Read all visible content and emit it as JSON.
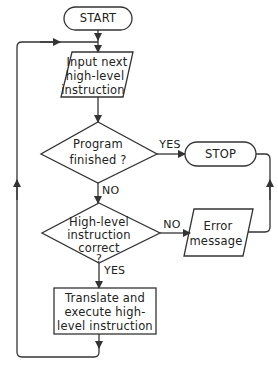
{
  "diagram": {
    "type": "flowchart",
    "colors": {
      "stroke": "#333333",
      "text": "#222222",
      "background": "#ffffff"
    },
    "nodes": {
      "start": {
        "shape": "terminator",
        "label": "START"
      },
      "input": {
        "shape": "parallelogram",
        "lines": [
          "Input next",
          "high-level",
          "instruction"
        ]
      },
      "decision1": {
        "shape": "diamond",
        "lines": [
          "Program",
          "finished ?"
        ]
      },
      "stop": {
        "shape": "terminator",
        "label": "STOP"
      },
      "decision2": {
        "shape": "diamond",
        "lines": [
          "High-level",
          "instruction",
          "correct",
          "?"
        ]
      },
      "error": {
        "shape": "parallelogram",
        "lines": [
          "Error",
          "message"
        ]
      },
      "process": {
        "shape": "rectangle",
        "lines": [
          "Translate and",
          "execute high-",
          "level instruction"
        ]
      }
    },
    "edges": {
      "d1_yes": "YES",
      "d1_no": "NO",
      "d2_no": "NO",
      "d2_yes": "YES"
    }
  }
}
